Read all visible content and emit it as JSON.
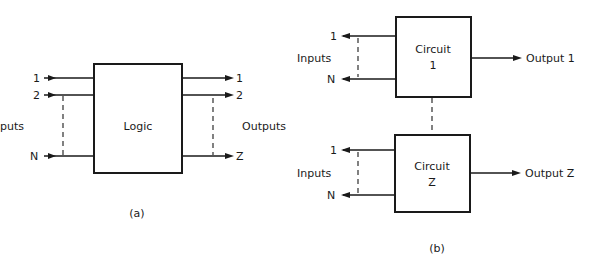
{
  "diagram_a": {
    "caption": "(a)",
    "block_label": "Logic",
    "inputs_label": "puts",
    "outputs_label": "Outputs",
    "input_lines": [
      "1",
      "2",
      "N"
    ],
    "output_lines": [
      "1",
      "2",
      "Z"
    ]
  },
  "diagram_b": {
    "caption": "(b)",
    "circuits": [
      {
        "title": "Circuit",
        "index": "1",
        "inputs_label": "Inputs",
        "input_lines": [
          "1",
          "N"
        ],
        "output_label": "Output 1"
      },
      {
        "title": "Circuit",
        "index": "Z",
        "inputs_label": "Inputs",
        "input_lines": [
          "1",
          "N"
        ],
        "output_label": "Output Z"
      }
    ]
  },
  "colors": {
    "ink": "#1a1a1a",
    "background": "#ffffff"
  }
}
